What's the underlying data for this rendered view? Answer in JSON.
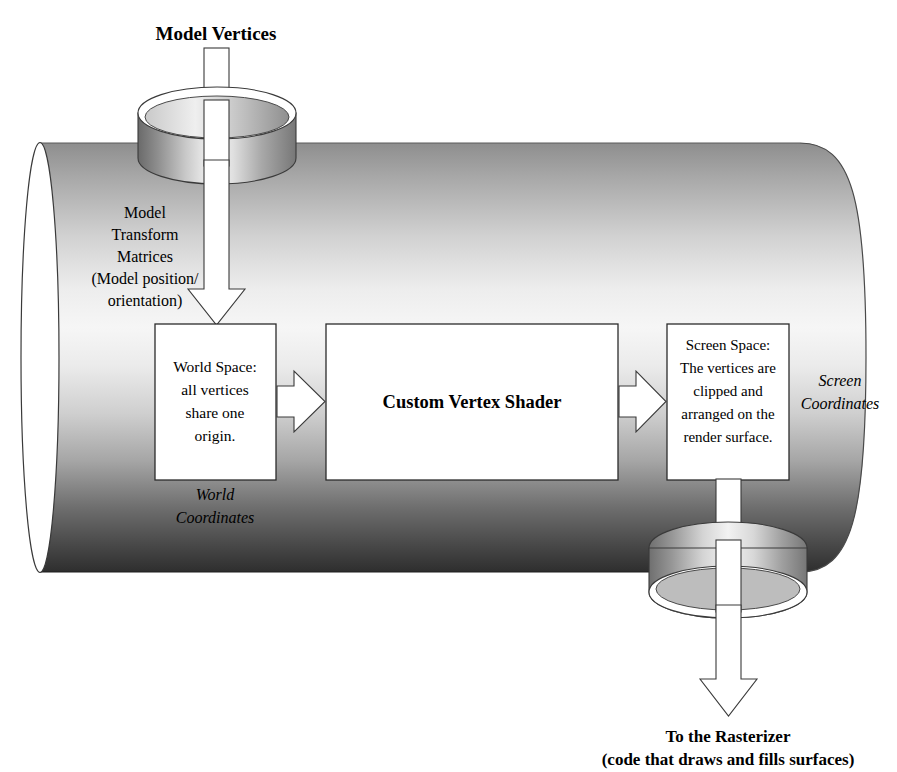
{
  "diagram": {
    "title_top": "Model Vertices",
    "footer_line1": "To the Rasterizer",
    "footer_line2": "(code that draws and fills surfaces)",
    "inlet_label_lines": [
      "Model",
      "Transform",
      "Matrices",
      "(Model position/",
      "orientation)"
    ],
    "boxes": [
      {
        "id": "world-space",
        "lines": [
          "World Space:",
          "all vertices",
          "share one",
          "origin."
        ],
        "bold": false
      },
      {
        "id": "custom-vertex-shader",
        "lines": [
          "Custom Vertex Shader"
        ],
        "bold": true
      },
      {
        "id": "screen-space",
        "lines": [
          "Screen Space:",
          "The vertices are",
          "clipped and",
          "arranged on the",
          "render surface."
        ],
        "bold": false
      }
    ],
    "caption_world": [
      "World",
      "Coordinates"
    ],
    "caption_screen": [
      "Screen",
      "Coordinates"
    ],
    "icons": {
      "inlet_disc": "cylinder-inlet-icon",
      "outlet_disc": "cylinder-outlet-icon",
      "pipe": "pipe-cylinder-icon",
      "down_arrow_in": "arrow-down-icon",
      "down_arrow_out": "arrow-down-icon",
      "flow_arrow_1": "arrow-right-icon",
      "flow_arrow_2": "arrow-right-icon"
    },
    "colors": {
      "stroke": "#2b2b2b",
      "fill_white": "#ffffff",
      "pipe_light": "#f2f2f2",
      "pipe_mid": "#b8b8b8",
      "pipe_dark": "#3a3a3a",
      "text": "#000000"
    }
  }
}
